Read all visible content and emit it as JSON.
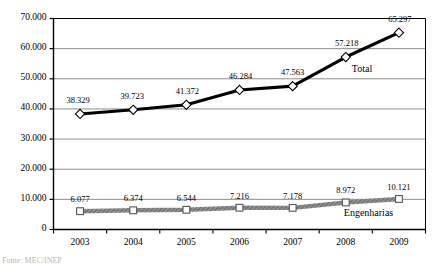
{
  "chart_data": {
    "type": "line",
    "title": "",
    "xlabel": "",
    "ylabel": "",
    "categories": [
      "2003",
      "2004",
      "2005",
      "2006",
      "2007",
      "2008",
      "2009"
    ],
    "ylim": [
      0,
      70000
    ],
    "ytick_values": [
      0,
      10000,
      20000,
      30000,
      40000,
      50000,
      60000,
      70000
    ],
    "ytick_labels": [
      "0",
      "10.000",
      "20.000",
      "30.000",
      "40.000",
      "50.000",
      "60.000",
      "70.000"
    ],
    "grid": true,
    "legend_position": "inline",
    "series": [
      {
        "name": "Total",
        "marker": "diamond",
        "color": "#000000",
        "values": [
          38329,
          39723,
          41372,
          46284,
          47563,
          57218,
          65297
        ],
        "labels": [
          "38.329",
          "39.723",
          "41.372",
          "46.284",
          "47.563",
          "57.218",
          "65.297"
        ]
      },
      {
        "name": "Engenharias",
        "marker": "square",
        "color": "#8c8c8c",
        "values": [
          6077,
          6374,
          6544,
          7216,
          7178,
          8972,
          10121
        ],
        "labels": [
          "6.077",
          "6.374",
          "6.544",
          "7.216",
          "7.178",
          "8.972",
          "10.121"
        ]
      }
    ],
    "annotations": [
      {
        "text": "Total",
        "series": "Total"
      },
      {
        "text": "Engenharias",
        "series": "Engenharias"
      }
    ]
  },
  "caption": {
    "text": "Fonte: MEC/INEP"
  },
  "colors": {
    "axis": "#000000",
    "grid": "#808080",
    "total_line": "#000000",
    "engenharias_line": "#8c8c8c",
    "marker_fill": "#ffffff",
    "caption": "#b9b9b9"
  }
}
